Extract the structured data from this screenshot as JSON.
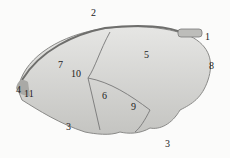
{
  "figure": {
    "labels": [
      {
        "id": "1",
        "text": "1",
        "x": 205,
        "y": 38
      },
      {
        "id": "2",
        "text": "2",
        "x": 91,
        "y": 14
      },
      {
        "id": "3a",
        "text": "3",
        "x": 66,
        "y": 128
      },
      {
        "id": "3b",
        "text": "3",
        "x": 165,
        "y": 145
      },
      {
        "id": "4",
        "text": "4",
        "x": 16,
        "y": 91
      },
      {
        "id": "5",
        "text": "5",
        "x": 144,
        "y": 56
      },
      {
        "id": "6",
        "text": "6",
        "x": 102,
        "y": 97
      },
      {
        "id": "7",
        "text": "7",
        "x": 58,
        "y": 66
      },
      {
        "id": "8",
        "text": "8",
        "x": 209,
        "y": 67
      },
      {
        "id": "9",
        "text": "9",
        "x": 131,
        "y": 108
      },
      {
        "id": "10",
        "text": "10",
        "x": 71,
        "y": 75
      },
      {
        "id": "11",
        "text": "11",
        "x": 24,
        "y": 95
      }
    ],
    "colors": {
      "background": "#fbfbfa",
      "organ": "#d9d9d7",
      "shade": "#b8b8b5",
      "outline": "#7a7a78"
    }
  }
}
